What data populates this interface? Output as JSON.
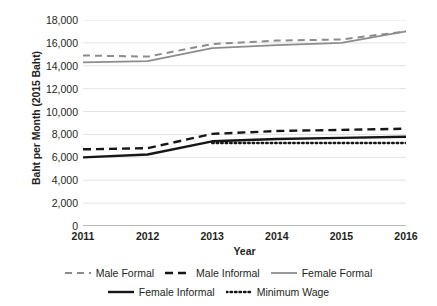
{
  "figure": {
    "top_cut_text": "",
    "background": "#ffffff"
  },
  "chart_data": {
    "type": "line",
    "title": "",
    "xlabel": "Year",
    "ylabel": "Baht per Month (2015 Baht)",
    "x": [
      2011,
      2012,
      2013,
      2014,
      2015,
      2016
    ],
    "x_tick_labels": [
      "2011",
      "2012",
      "2013",
      "2014",
      "2015",
      "2016"
    ],
    "y_tick_labels": [
      "0",
      "2,000",
      "4,000",
      "6,000",
      "8,000",
      "10,000",
      "12,000",
      "14,000",
      "16,000",
      "18,000"
    ],
    "y_tick_values": [
      0,
      2000,
      4000,
      6000,
      8000,
      10000,
      12000,
      14000,
      16000,
      18000
    ],
    "ylim": [
      0,
      18000
    ],
    "xlim": [
      2011,
      2016
    ],
    "grid": "horizontal",
    "legend_position": "bottom",
    "series": [
      {
        "name": "Male Formal",
        "style": "dashed",
        "color": "#8c8c8c",
        "width": 2.0,
        "dash": "7,5",
        "values": [
          14900,
          14800,
          15900,
          16200,
          16300,
          17000
        ]
      },
      {
        "name": "Male Informal",
        "style": "dashed",
        "color": "#161616",
        "width": 2.4,
        "dash": "8,5",
        "values": [
          6700,
          6800,
          8050,
          8300,
          8400,
          8500
        ]
      },
      {
        "name": "Female Formal",
        "style": "solid",
        "color": "#8c8c8c",
        "width": 1.8,
        "dash": "",
        "values": [
          14300,
          14400,
          15550,
          15800,
          16000,
          17000
        ]
      },
      {
        "name": "Female Informal",
        "style": "solid",
        "color": "#161616",
        "width": 2.4,
        "dash": "",
        "values": [
          6000,
          6250,
          7400,
          7600,
          7700,
          7800
        ]
      },
      {
        "name": "Minimum Wage",
        "style": "dotted",
        "color": "#161616",
        "width": 2.4,
        "dash": "1.5,3",
        "x_start": 2013,
        "values": [
          null,
          null,
          7250,
          7250,
          7250,
          7250
        ]
      }
    ]
  }
}
